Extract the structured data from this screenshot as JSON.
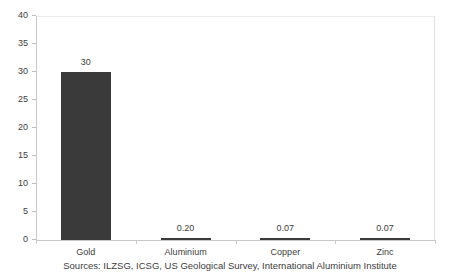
{
  "chart_data": {
    "type": "bar",
    "title": "",
    "subtitle": "",
    "xlabel": "",
    "ylabel": "",
    "categories": [
      "Gold",
      "Aluminium",
      "Copper",
      "Zinc"
    ],
    "values": [
      30,
      0.2,
      0.07,
      0.07
    ],
    "data_labels": [
      "30",
      "0.20",
      "0.07",
      "0.07"
    ],
    "ylim": [
      0,
      40
    ],
    "ytick_step": 5,
    "ytick_labels": [
      "0",
      "5",
      "10",
      "15",
      "20",
      "25",
      "30",
      "35",
      "40"
    ],
    "ytick_values": [
      0,
      5,
      10,
      15,
      20,
      25,
      30,
      35,
      40
    ],
    "grid": false,
    "gridline_top_only": true,
    "legend": null,
    "legend_position": "none",
    "annotations": [
      "Sources: ILZSG, ICSG, US Geological Survey, International Aluminium Institute"
    ],
    "series": [
      {
        "name": "",
        "values": [
          30,
          0.2,
          0.07,
          0.07
        ]
      }
    ]
  },
  "footnote": {
    "text": "Sources: ILZSG, ICSG, US Geological Survey, International Aluminium Institute"
  },
  "colors": {
    "bar": "#3a3a3a",
    "axis": "#c9c9c9",
    "gridline": "#ececec",
    "text": "#3d3d3d",
    "background": "#ffffff"
  }
}
